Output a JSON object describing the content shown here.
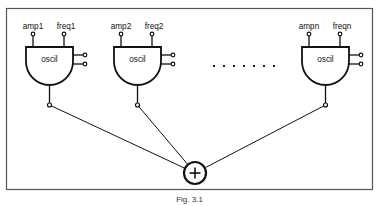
{
  "figure": {
    "caption": "Fig. 3.1",
    "frame": {
      "x": 6,
      "y": 8,
      "width": 367,
      "height": 182,
      "color": "#555555"
    }
  },
  "summing_node": {
    "symbol": "+",
    "label": "summing-junction",
    "cx": 195,
    "cy": 173,
    "r": 11
  },
  "ellipsis": {
    "count": 7,
    "y": 65,
    "x_start": 213,
    "x_step": 10
  },
  "oscillators": [
    {
      "id": "osc1",
      "block_label": "oscil",
      "amp_label": "amp1",
      "freq_label": "freq1",
      "x": 26,
      "y": 47,
      "width": 47,
      "height": 38
    },
    {
      "id": "osc2",
      "block_label": "oscil",
      "amp_label": "amp2",
      "freq_label": "freq2",
      "x": 114,
      "y": 47,
      "width": 47,
      "height": 38
    },
    {
      "id": "oscn",
      "block_label": "oscil",
      "amp_label": "ampn",
      "freq_label": "freqn",
      "x": 302,
      "y": 47,
      "width": 47,
      "height": 38
    }
  ]
}
